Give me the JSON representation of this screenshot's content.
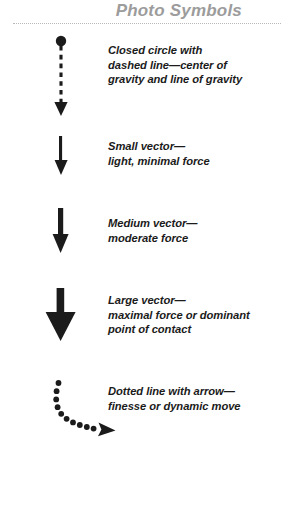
{
  "header": {
    "title": "Photo Symbols",
    "divider": "dotted-rule"
  },
  "colors": {
    "title": "#9c9c9c",
    "rule": "#b9b9b9",
    "symbol": "#1b1b1b",
    "text": "#1b1b1b",
    "background": "#ffffff"
  },
  "legend": {
    "items": [
      {
        "key": "gravity",
        "icon": "closed-circle-dashed-arrow-icon",
        "lines": [
          "Closed circle with",
          "dashed line—center of",
          "gravity and line of gravity"
        ]
      },
      {
        "key": "small",
        "icon": "small-down-arrow-icon",
        "lines": [
          "Small vector—",
          "light, minimal force"
        ]
      },
      {
        "key": "medium",
        "icon": "medium-down-arrow-icon",
        "lines": [
          "Medium vector—",
          "moderate force"
        ]
      },
      {
        "key": "large",
        "icon": "large-down-arrow-icon",
        "lines": [
          "Large vector—",
          "maximal force or dominant",
          "point of contact"
        ]
      },
      {
        "key": "dotted",
        "icon": "curved-dotted-arrow-icon",
        "lines": [
          "Dotted line with arrow—",
          "finesse or dynamic move"
        ]
      }
    ]
  }
}
